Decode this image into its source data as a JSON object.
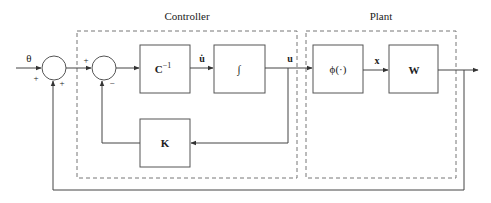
{
  "diagram": {
    "type": "control-block-diagram",
    "groups": {
      "controller": {
        "title": "Controller"
      },
      "plant": {
        "title": "Plant"
      }
    },
    "input": {
      "label": "θ"
    },
    "summing_junctions": [
      {
        "id": "sum1",
        "signs": {
          "left": "+",
          "bottom": "+"
        }
      },
      {
        "id": "sum2",
        "signs": {
          "left": "+",
          "bottom": "−"
        }
      }
    ],
    "blocks": {
      "c_inv": {
        "label": "C",
        "superscript": "−1"
      },
      "integrator": {
        "label": "∫"
      },
      "k": {
        "label": "K"
      },
      "phi": {
        "label": "ϕ(·)"
      },
      "w": {
        "label": "W"
      }
    },
    "signals": {
      "u_dot": "u̇",
      "u": "u",
      "x": "x"
    },
    "colors": {
      "line": "#555555",
      "dashed": "#777777",
      "text": "#222222",
      "background": "#ffffff"
    }
  }
}
